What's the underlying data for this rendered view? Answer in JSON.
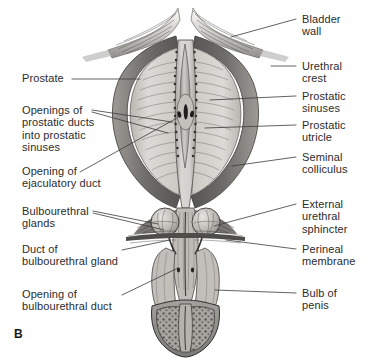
{
  "figure": {
    "panel_letter": "B",
    "style": "grayscale medical illustration",
    "colors": {
      "background": "#ffffff",
      "text": "#2b2b2b",
      "leader_line": "#3a3a3a",
      "capsule_dark": "#6e6e6e",
      "capsule_mid": "#8c8c8c",
      "gland_light": "#d8d6d2",
      "gland_mid": "#c0bdb8",
      "urethra_light": "#cfcdc9",
      "bladder_wall": "#9a9a9a",
      "spongy_tissue": "#8e8c88",
      "outline": "#2f2f2f"
    }
  },
  "labels_left": [
    {
      "id": "prostate",
      "lines": [
        "Prostate"
      ]
    },
    {
      "id": "prostatic-ducts",
      "lines": [
        "Openings of",
        "prostatic ducts",
        "into prostatic",
        "sinuses"
      ]
    },
    {
      "id": "ejaculatory-duct",
      "lines": [
        "Opening of",
        "ejaculatory duct"
      ]
    },
    {
      "id": "bulbourethral-glands",
      "lines": [
        "Bulbourethral",
        "glands"
      ]
    },
    {
      "id": "bulbourethral-duct",
      "lines": [
        "Duct of",
        "bulbourethral gland"
      ]
    },
    {
      "id": "bulbourethral-duct-opening",
      "lines": [
        "Opening of",
        "bulbourethral duct"
      ]
    }
  ],
  "labels_right": [
    {
      "id": "bladder-wall",
      "lines": [
        "Bladder",
        "wall"
      ]
    },
    {
      "id": "urethral-crest",
      "lines": [
        "Urethral",
        "crest"
      ]
    },
    {
      "id": "prostatic-sinuses",
      "lines": [
        "Prostatic",
        "sinuses"
      ]
    },
    {
      "id": "prostatic-utricle",
      "lines": [
        "Prostatic",
        "utricle"
      ]
    },
    {
      "id": "seminal-colliculus",
      "lines": [
        "Seminal",
        "colliculus"
      ]
    },
    {
      "id": "external-sphincter",
      "lines": [
        "External",
        "urethral",
        "sphincter"
      ]
    },
    {
      "id": "perineal-membrane",
      "lines": [
        "Perineal",
        "membrane"
      ]
    },
    {
      "id": "bulb-of-penis",
      "lines": [
        "Bulb of",
        "penis"
      ]
    }
  ]
}
